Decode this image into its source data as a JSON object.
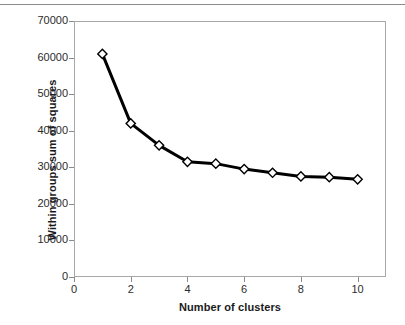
{
  "chart_data": {
    "type": "line",
    "title": "",
    "xlabel": "Number of clusters",
    "ylabel": "Within groups sum of squares",
    "x": [
      1,
      2,
      3,
      4,
      5,
      6,
      7,
      8,
      9,
      10
    ],
    "values": [
      61000,
      42000,
      36000,
      31500,
      31000,
      29500,
      28500,
      27500,
      27300,
      26700
    ],
    "series": [
      {
        "name": "Within groups sum of squares",
        "values": [
          61000,
          42000,
          36000,
          31500,
          31000,
          29500,
          28500,
          27500,
          27300,
          26700
        ]
      }
    ],
    "xlim": [
      0,
      11
    ],
    "ylim": [
      0,
      70000
    ],
    "xticks": [
      0,
      2,
      4,
      6,
      8,
      10
    ],
    "xtick_labels": [
      "0",
      "2",
      "4",
      "6",
      "8",
      "10"
    ],
    "yticks": [
      0,
      10000,
      20000,
      30000,
      40000,
      50000,
      60000,
      70000
    ],
    "ytick_labels": [
      "0",
      "10000",
      "20000",
      "30000",
      "40000",
      "50000",
      "60000",
      "70000"
    ],
    "grid": false,
    "legend": false,
    "marker": "diamond",
    "marker_fill": "#ffffff",
    "marker_stroke": "#000000",
    "line_color": "#000000",
    "line_width": 3,
    "axis_color": "#a8a8a8",
    "text_color": "#1a1a1a",
    "background": "#ffffff"
  }
}
